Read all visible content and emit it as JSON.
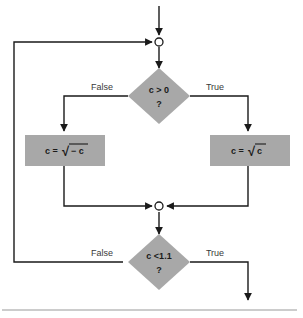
{
  "diagram": {
    "colors": {
      "shape_fill": "#a8a8a8",
      "line": "#1a1a1a",
      "background": "#ffffff",
      "rule": "#9a9a9a",
      "label_text": "#3a3a3a"
    },
    "nodes": {
      "junction_top": {
        "type": "junction",
        "label": ""
      },
      "decision_1": {
        "type": "decision",
        "line1": "c > 0",
        "line2": "?"
      },
      "process_left": {
        "type": "process",
        "expr_lhs": "c =",
        "expr_radicand": "− c"
      },
      "process_right": {
        "type": "process",
        "expr_lhs": "c =",
        "expr_radicand": "c"
      },
      "junction_middle": {
        "type": "junction",
        "label": ""
      },
      "decision_2": {
        "type": "decision",
        "line1": "c <1.1",
        "line2": "?"
      }
    },
    "edge_labels": {
      "d1_false": "False",
      "d1_true": "True",
      "d2_false": "False",
      "d2_true": "True"
    },
    "symbols": {
      "radical": "√",
      "minus": "−"
    }
  }
}
